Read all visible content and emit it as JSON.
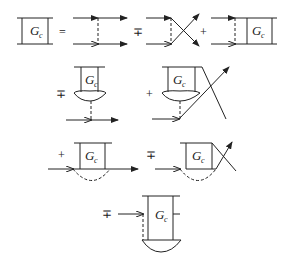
{
  "diagram": {
    "type": "feynman-diagram-equation",
    "box_label": "G",
    "box_subscript": "c",
    "operators": {
      "equals": "=",
      "minus_plus": "∓",
      "plus": "+"
    },
    "rows": [
      {
        "terms": [
          "G_c box",
          "=",
          "ladder exchange",
          "∓",
          "crossed exchange",
          "+",
          "exchange + G_c box"
        ]
      },
      {
        "terms": [
          "∓",
          "G_c cap with dashed line to propagator",
          "+",
          "G_c cap crossed"
        ]
      },
      {
        "terms": [
          "+",
          "G_c self-energy loop",
          "∓",
          "G_c crossed loop"
        ]
      },
      {
        "terms": [
          "∓",
          "G_c with dashed line to cap"
        ]
      }
    ],
    "colors": {
      "stroke": "#222222",
      "background": "#ffffff"
    }
  }
}
